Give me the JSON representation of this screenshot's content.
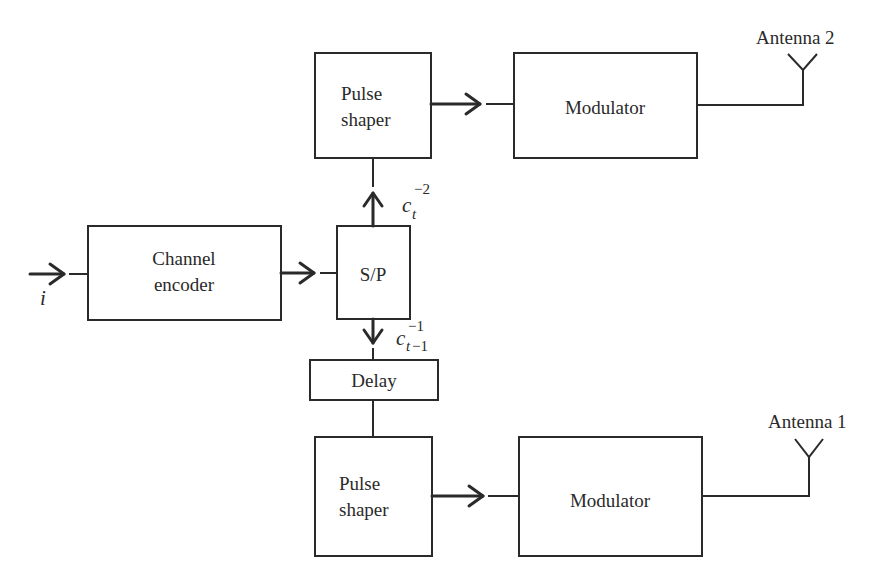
{
  "diagram": {
    "type": "block-diagram",
    "input": {
      "symbol": "i"
    },
    "blocks": {
      "channel_encoder": {
        "line1": "Channel",
        "line2": "encoder"
      },
      "sp": {
        "label": "S/P"
      },
      "delay": {
        "label": "Delay"
      },
      "pulse_shaper_top": {
        "line1": "Pulse",
        "line2": "shaper"
      },
      "pulse_shaper_bottom": {
        "line1": "Pulse",
        "line2": "shaper"
      },
      "modulator_top": {
        "label": "Modulator"
      },
      "modulator_bottom": {
        "label": "Modulator"
      }
    },
    "signals": {
      "upper": {
        "base": "c",
        "sub": "t",
        "sup": "−2"
      },
      "lower": {
        "base": "c",
        "sub_var": "t",
        "sub_rest": "−1",
        "sup": "−1"
      }
    },
    "antennas": {
      "top": {
        "label": "Antenna 2"
      },
      "bottom": {
        "label": "Antenna 1"
      }
    },
    "colors": {
      "stroke": "#2a2a2a",
      "background": "#ffffff"
    }
  }
}
